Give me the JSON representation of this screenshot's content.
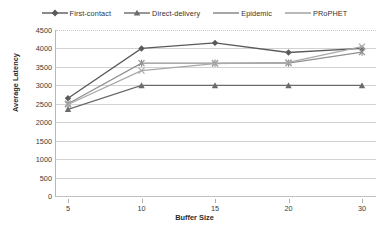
{
  "chart_data": {
    "type": "line",
    "title": "",
    "xlabel": "Buffer Size",
    "ylabel": "Average Latency",
    "x": [
      5,
      10,
      15,
      20,
      30
    ],
    "xtick_labels": [
      "5",
      "10",
      "15",
      "20",
      "30"
    ],
    "ytick_labels": [
      "0",
      "500",
      "1000",
      "1500",
      "2000",
      "2500",
      "3000",
      "3500",
      "4000",
      "4500"
    ],
    "ylim": [
      0,
      4500
    ],
    "ystep": 500,
    "grid": true,
    "legend_position": "top-center",
    "series": [
      {
        "name": "First-contact",
        "marker": "diamond",
        "color": "#5a5a5a",
        "values": [
          2650,
          4000,
          4150,
          3890,
          4000
        ]
      },
      {
        "name": "Direct-delivery",
        "marker": "triangle",
        "color": "#6b6b6b",
        "values": [
          2350,
          3000,
          3000,
          3000,
          3000
        ]
      },
      {
        "name": "Epidemic",
        "marker": "asterisk",
        "color": "#909090",
        "values": [
          2500,
          3600,
          3600,
          3600,
          3900
        ]
      },
      {
        "name": "PRoPHET",
        "marker": "cross",
        "color": "#a8a8a8",
        "values": [
          2480,
          3400,
          3590,
          3620,
          4050
        ]
      }
    ]
  },
  "legend": {
    "items": [
      {
        "label": "First-contact"
      },
      {
        "label": "Direct-delivery"
      },
      {
        "label": "Epidemic"
      },
      {
        "label": "PRoPHET"
      }
    ]
  }
}
